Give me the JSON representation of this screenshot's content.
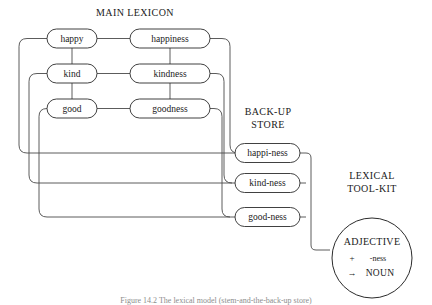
{
  "figure": {
    "title_main": "MAIN LEXICON",
    "title_backup": "BACK-UP STORE",
    "title_backup_line1": "BACK-UP",
    "title_backup_line2": "STORE",
    "title_toolkit_line1": "LEXICAL",
    "title_toolkit_line2": "TOOL-KIT",
    "caption": "Figure 14.2  The lexical model (stem-and-the-back-up store)",
    "ink_color": "#2b2b2b",
    "line_color": "#4a4a4a",
    "background_color": "#ffffff"
  },
  "main_lexicon": {
    "adjectives": [
      {
        "id": "happy",
        "label": "happy"
      },
      {
        "id": "kind",
        "label": "kind"
      },
      {
        "id": "good",
        "label": "good"
      }
    ],
    "nouns": [
      {
        "id": "happiness",
        "label": "happiness"
      },
      {
        "id": "kindness",
        "label": "kindness"
      },
      {
        "id": "goodness",
        "label": "goodness"
      }
    ]
  },
  "backup_store": {
    "items": [
      {
        "id": "happi-ness",
        "label": "happi-ness"
      },
      {
        "id": "kind-ness",
        "label": "kind-ness"
      },
      {
        "id": "good-ness",
        "label": "good-ness"
      }
    ]
  },
  "lexical_toolkit": {
    "rule_input": "ADJECTIVE",
    "rule_operator": "+",
    "rule_affix": "-ness",
    "rule_arrow": "→",
    "rule_output": "NOUN"
  }
}
